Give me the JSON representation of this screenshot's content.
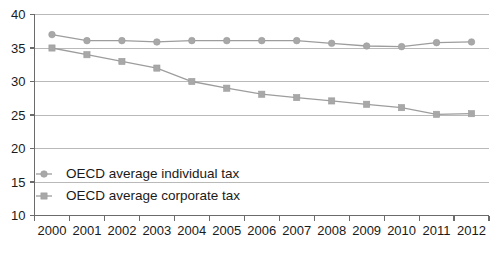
{
  "chart_data": {
    "type": "line",
    "title": "",
    "xlabel": "",
    "ylabel": "",
    "ylim": [
      10,
      40
    ],
    "yticks": [
      10,
      15,
      20,
      25,
      30,
      35,
      40
    ],
    "grid": true,
    "legend_position": "inside-lower-left",
    "categories": [
      "2000",
      "2001",
      "2002",
      "2003",
      "2004",
      "2005",
      "2006",
      "2007",
      "2008",
      "2009",
      "2010",
      "2011",
      "2012"
    ],
    "x": [
      2000,
      2001,
      2002,
      2003,
      2004,
      2005,
      2006,
      2007,
      2008,
      2009,
      2010,
      2011,
      2012
    ],
    "series": [
      {
        "name": "OECD average individual tax",
        "marker": "circle",
        "color": "#a8a8a8",
        "values": [
          37.0,
          36.1,
          36.1,
          35.9,
          36.1,
          36.1,
          36.1,
          36.1,
          35.7,
          35.3,
          35.2,
          35.8,
          35.9
        ]
      },
      {
        "name": "OECD average corporate tax",
        "marker": "square",
        "color": "#a8a8a8",
        "values": [
          35.0,
          34.0,
          33.0,
          32.0,
          30.0,
          29.0,
          28.1,
          27.6,
          27.1,
          26.6,
          26.1,
          25.1,
          25.2
        ]
      }
    ]
  },
  "legend": {
    "items": [
      {
        "label": "OECD average individual tax",
        "marker": "circle"
      },
      {
        "label": "OECD average corporate tax",
        "marker": "square"
      }
    ]
  },
  "colors": {
    "series": "#a8a8a8",
    "line": "#9d9d9d",
    "grid": "#b9b9b9",
    "axis": "#6b6b6b",
    "text": "#1a1a1a",
    "background": "#ffffff"
  }
}
